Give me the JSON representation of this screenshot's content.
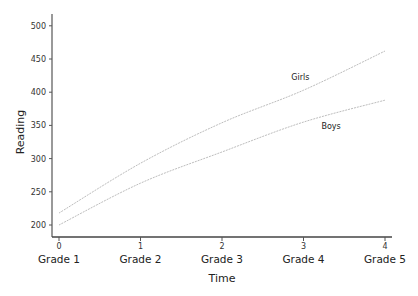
{
  "chart_data": {
    "type": "line",
    "title": "",
    "xlabel": "Time",
    "ylabel": "Reading",
    "x": [
      0,
      1,
      2,
      3,
      4
    ],
    "x_tick_labels": [
      "0",
      "1",
      "2",
      "3",
      "4"
    ],
    "categories": [
      "Grade 1",
      "Grade 2",
      "Grade 3",
      "Grade 4",
      "Grade 5"
    ],
    "y_ticks": [
      200,
      250,
      300,
      350,
      400,
      450,
      500
    ],
    "ylim": [
      182,
      522
    ],
    "xlim": [
      -0.1,
      4.1
    ],
    "grid": false,
    "legend": "inline labels",
    "series": [
      {
        "name": "Girls",
        "values": [
          218,
          293,
          354,
          403,
          462
        ],
        "color": "#bdbdbd"
      },
      {
        "name": "Boys",
        "values": [
          200,
          263,
          310,
          355,
          388
        ],
        "color": "#bdbdbd"
      }
    ],
    "annotations": [
      {
        "text": "Girls",
        "x": 2.85,
        "y": 419
      },
      {
        "text": "Boys",
        "x": 3.22,
        "y": 345
      }
    ]
  }
}
